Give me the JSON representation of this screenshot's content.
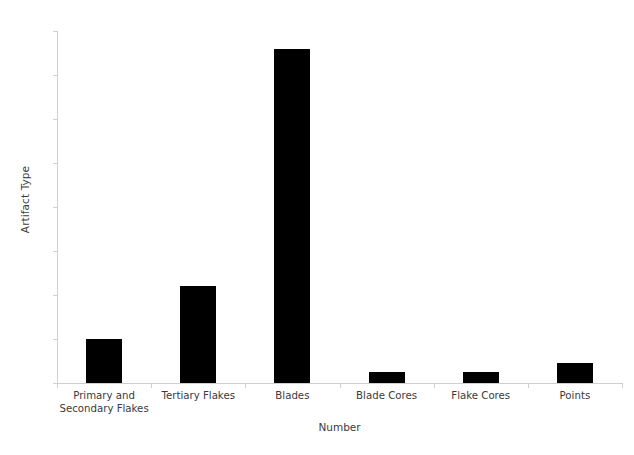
{
  "chart_data": {
    "type": "bar",
    "title": "",
    "subtitle": "",
    "xlabel": "Number",
    "ylabel": "Artifact Type",
    "categories": [
      "Primary and\nSecondary Flakes",
      "Tertiary Flakes",
      "Blades",
      "Blade Cores",
      "Flake Cores",
      "Points"
    ],
    "category_lines": [
      [
        "Primary and",
        "Secondary Flakes"
      ],
      [
        "Tertiary Flakes"
      ],
      [
        "Blades"
      ],
      [
        "Blade Cores"
      ],
      [
        "Flake Cores"
      ],
      [
        "Points"
      ]
    ],
    "values": [
      5,
      11,
      38,
      1.2,
      1.2,
      2.3
    ],
    "ylim": [
      0,
      40
    ],
    "yticks": [
      0,
      5,
      10,
      15,
      20,
      25,
      30,
      35,
      40
    ],
    "ytick_labels": [
      "0",
      "5",
      "10",
      "15",
      "20",
      "25",
      "30",
      "35",
      "40"
    ],
    "grid": false,
    "legend": false,
    "legend_position": "none",
    "bar_color": "#000000",
    "axis_color": "#cfcfcf",
    "text_color": "#3a3a3a"
  }
}
